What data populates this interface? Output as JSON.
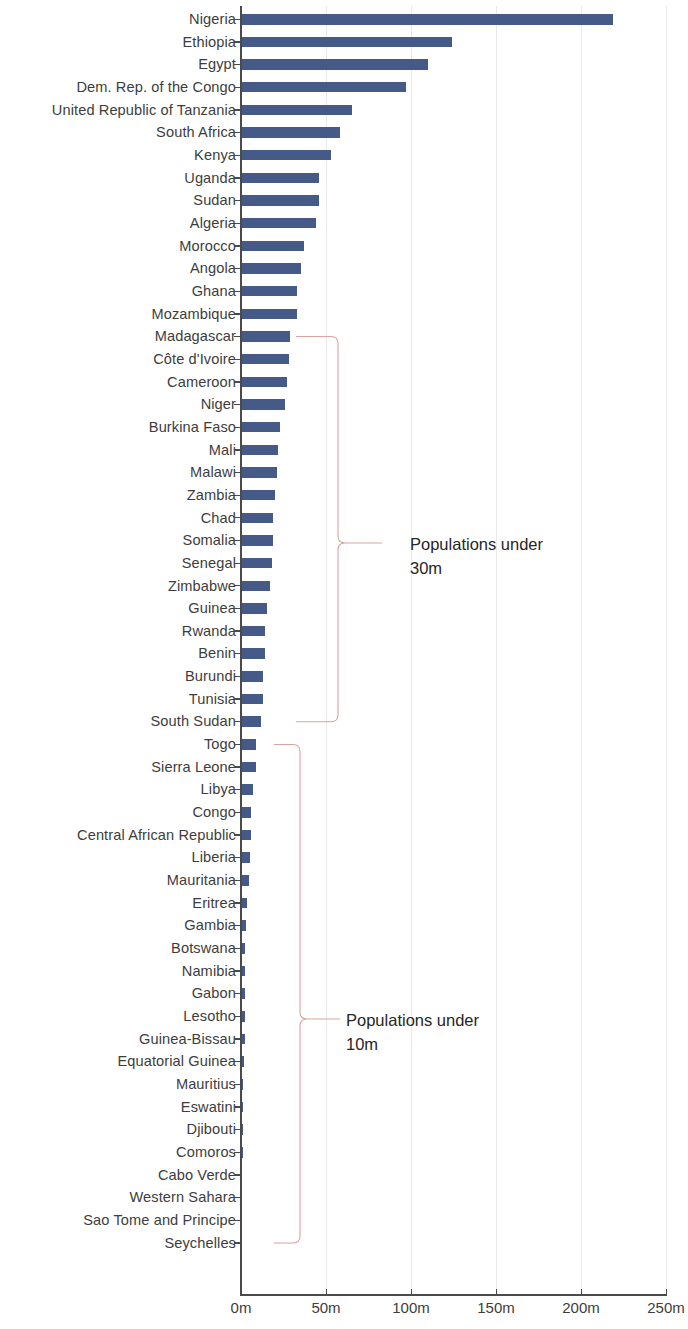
{
  "chart_data": {
    "type": "bar",
    "orientation": "horizontal",
    "title": "",
    "xlabel": "",
    "ylabel": "",
    "xlim": [
      0,
      250
    ],
    "xticks": [
      0,
      50,
      100,
      150,
      200,
      250
    ],
    "xtick_labels": [
      "0m",
      "50m",
      "100m",
      "150m",
      "200m",
      "250m"
    ],
    "grid": true,
    "grid_axis": "x",
    "legend": null,
    "bar_color": "#465a88",
    "annotation_color": "#d9a3a0",
    "label_color": "#3d3d3d",
    "categories": [
      "Nigeria",
      "Ethiopia",
      "Egypt",
      "Dem. Rep. of the Congo",
      "United Republic of Tanzania",
      "South Africa",
      "Kenya",
      "Uganda",
      "Sudan",
      "Algeria",
      "Morocco",
      "Angola",
      "Ghana",
      "Mozambique",
      "Madagascar",
      "Côte d'Ivoire",
      "Cameroon",
      "Niger",
      "Burkina Faso",
      "Mali",
      "Malawi",
      "Zambia",
      "Chad",
      "Somalia",
      "Senegal",
      "Zimbabwe",
      "Guinea",
      "Rwanda",
      "Benin",
      "Burundi",
      "Tunisia",
      "South Sudan",
      "Togo",
      "Sierra Leone",
      "Libya",
      "Congo",
      "Central African Republic",
      "Liberia",
      "Mauritania",
      "Eritrea",
      "Gambia",
      "Botswana",
      "Namibia",
      "Gabon",
      "Lesotho",
      "Guinea-Bissau",
      "Equatorial Guinea",
      "Mauritius",
      "Eswatini",
      "Djibouti",
      "Comoros",
      "Cabo Verde",
      "Western Sahara",
      "Sao Tome and Principe",
      "Seychelles"
    ],
    "values": [
      219,
      124,
      110,
      97,
      65,
      58,
      53,
      46,
      46,
      44,
      37,
      35,
      33,
      33,
      29,
      28,
      27,
      26,
      23,
      22,
      21,
      20,
      19,
      19,
      18,
      17,
      15,
      14,
      14,
      13,
      13,
      12,
      9,
      8.7,
      7,
      6,
      5.7,
      5.4,
      4.9,
      3.7,
      2.8,
      2.6,
      2.6,
      2.4,
      2.2,
      2.2,
      1.6,
      1.3,
      1.2,
      1.1,
      0.9,
      0.6,
      0.6,
      0.23,
      0.1
    ],
    "value_unit": "millions",
    "annotations": [
      {
        "text": "Populations under\n30m",
        "bracket_from_category": "Madagascar",
        "bracket_to_category": "South Sudan",
        "text_x": 410,
        "text_y": 532
      },
      {
        "text": "Populations under\n10m",
        "bracket_from_category": "Togo",
        "bracket_to_category": "Seychelles",
        "text_x": 346,
        "text_y": 1008
      }
    ]
  }
}
